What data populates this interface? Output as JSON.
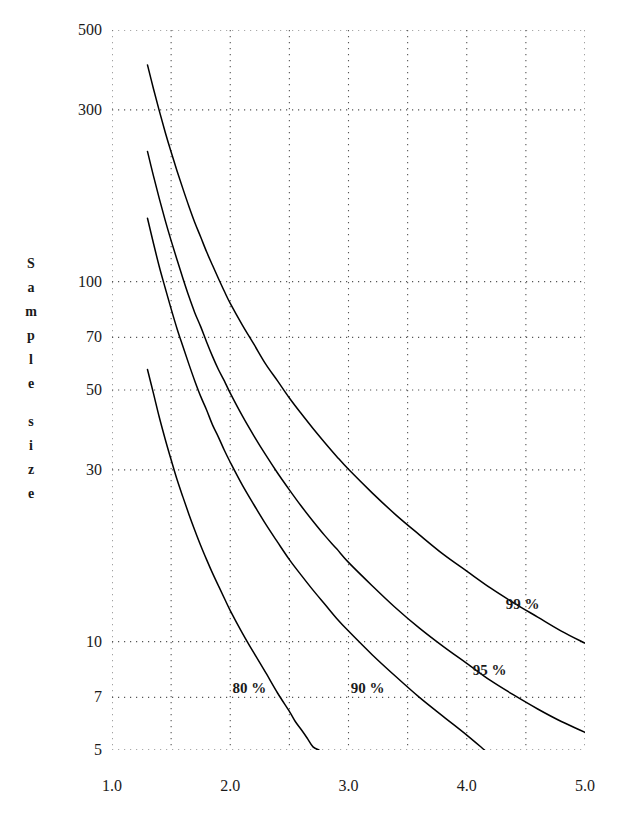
{
  "chart_data": {
    "type": "line",
    "title": "",
    "xlabel": "",
    "ylabel": "Sample size",
    "ylabel_chars": [
      "S",
      "a",
      "m",
      "p",
      "l",
      "e",
      "",
      "s",
      "i",
      "z",
      "e"
    ],
    "xlim": [
      1.0,
      5.0
    ],
    "ylim": [
      5,
      500
    ],
    "yscale": "log",
    "xscale": "linear",
    "grid": true,
    "grid_style": "dotted",
    "grid_color": "#555555",
    "line_color": "#000000",
    "background": "#ffffff",
    "legend_position": "inline-labels",
    "xticks": [
      "1.0",
      "2.0",
      "3.0",
      "4.0",
      "5.0"
    ],
    "xtick_values": [
      1.0,
      2.0,
      3.0,
      4.0,
      5.0
    ],
    "yticks": [
      "500",
      "300",
      "100",
      "70",
      "50",
      "30",
      "10",
      "7",
      "5"
    ],
    "ytick_values": [
      500,
      300,
      100,
      70,
      50,
      30,
      10,
      7,
      5
    ],
    "x_minor_gridlines": [
      1.5,
      2.5,
      3.5,
      4.5
    ],
    "series": [
      {
        "name": "80 %",
        "label": "80 %",
        "label_x": 2.02,
        "label_y": 7.4,
        "points": [
          [
            1.3,
            57
          ],
          [
            1.35,
            49
          ],
          [
            1.4,
            42
          ],
          [
            1.45,
            36.5
          ],
          [
            1.5,
            32
          ],
          [
            1.55,
            28.2
          ],
          [
            1.6,
            25.2
          ],
          [
            1.65,
            22.6
          ],
          [
            1.7,
            20.4
          ],
          [
            1.75,
            18.5
          ],
          [
            1.8,
            16.9
          ],
          [
            1.85,
            15.5
          ],
          [
            1.9,
            14.3
          ],
          [
            1.95,
            13.2
          ],
          [
            2.0,
            12.2
          ],
          [
            2.1,
            10.6
          ],
          [
            2.2,
            9.3
          ],
          [
            2.3,
            8.2
          ],
          [
            2.4,
            7.2
          ],
          [
            2.5,
            6.4
          ],
          [
            2.55,
            6.0
          ],
          [
            2.6,
            5.7
          ],
          [
            2.65,
            5.4
          ],
          [
            2.7,
            5.1
          ],
          [
            2.75,
            5.0
          ]
        ]
      },
      {
        "name": "90 %",
        "label": "90 %",
        "label_x": 3.02,
        "label_y": 7.4,
        "points": [
          [
            1.3,
            150
          ],
          [
            1.35,
            128
          ],
          [
            1.4,
            110
          ],
          [
            1.45,
            96
          ],
          [
            1.5,
            84
          ],
          [
            1.55,
            74
          ],
          [
            1.6,
            66
          ],
          [
            1.65,
            59
          ],
          [
            1.7,
            53
          ],
          [
            1.75,
            48
          ],
          [
            1.8,
            44
          ],
          [
            1.85,
            40
          ],
          [
            1.9,
            37
          ],
          [
            1.95,
            34
          ],
          [
            2.0,
            31.5
          ],
          [
            2.1,
            27.3
          ],
          [
            2.2,
            24.0
          ],
          [
            2.3,
            21.2
          ],
          [
            2.4,
            18.9
          ],
          [
            2.5,
            16.9
          ],
          [
            2.6,
            15.3
          ],
          [
            2.7,
            13.9
          ],
          [
            2.8,
            12.7
          ],
          [
            2.9,
            11.6
          ],
          [
            3.0,
            10.7
          ],
          [
            3.2,
            9.2
          ],
          [
            3.4,
            8.0
          ],
          [
            3.6,
            7.0
          ],
          [
            3.8,
            6.2
          ],
          [
            4.0,
            5.5
          ],
          [
            4.15,
            5.0
          ]
        ]
      },
      {
        "name": "95 %",
        "label": "95 %",
        "label_x": 4.05,
        "label_y": 8.3,
        "points": [
          [
            1.3,
            230
          ],
          [
            1.35,
            197
          ],
          [
            1.4,
            170
          ],
          [
            1.45,
            148
          ],
          [
            1.5,
            130
          ],
          [
            1.55,
            115
          ],
          [
            1.6,
            102
          ],
          [
            1.65,
            91
          ],
          [
            1.7,
            82
          ],
          [
            1.75,
            75
          ],
          [
            1.8,
            68
          ],
          [
            1.85,
            62
          ],
          [
            1.9,
            57
          ],
          [
            1.95,
            53
          ],
          [
            2.0,
            49
          ],
          [
            2.1,
            42.5
          ],
          [
            2.2,
            37.3
          ],
          [
            2.3,
            33.0
          ],
          [
            2.4,
            29.4
          ],
          [
            2.5,
            26.4
          ],
          [
            2.6,
            23.8
          ],
          [
            2.7,
            21.6
          ],
          [
            2.8,
            19.7
          ],
          [
            2.9,
            18.1
          ],
          [
            3.0,
            16.6
          ],
          [
            3.2,
            14.3
          ],
          [
            3.4,
            12.4
          ],
          [
            3.6,
            10.9
          ],
          [
            3.8,
            9.7
          ],
          [
            4.0,
            8.7
          ],
          [
            4.2,
            7.8
          ],
          [
            4.4,
            7.1
          ],
          [
            4.6,
            6.5
          ],
          [
            4.8,
            6.0
          ],
          [
            5.0,
            5.6
          ]
        ]
      },
      {
        "name": "99 %",
        "label": "99 %",
        "label_x": 4.33,
        "label_y": 12.6,
        "points": [
          [
            1.3,
            400
          ],
          [
            1.35,
            344
          ],
          [
            1.4,
            298
          ],
          [
            1.45,
            260
          ],
          [
            1.5,
            229
          ],
          [
            1.55,
            203
          ],
          [
            1.6,
            181
          ],
          [
            1.65,
            162
          ],
          [
            1.7,
            146
          ],
          [
            1.75,
            133
          ],
          [
            1.8,
            121
          ],
          [
            1.85,
            111
          ],
          [
            1.9,
            102
          ],
          [
            1.95,
            94
          ],
          [
            2.0,
            87
          ],
          [
            2.1,
            76
          ],
          [
            2.2,
            67
          ],
          [
            2.3,
            59
          ],
          [
            2.4,
            53
          ],
          [
            2.5,
            47.5
          ],
          [
            2.6,
            43.0
          ],
          [
            2.7,
            39.1
          ],
          [
            2.8,
            35.7
          ],
          [
            2.9,
            32.7
          ],
          [
            3.0,
            30.1
          ],
          [
            3.2,
            25.9
          ],
          [
            3.4,
            22.5
          ],
          [
            3.6,
            19.8
          ],
          [
            3.8,
            17.5
          ],
          [
            4.0,
            15.7
          ],
          [
            4.2,
            14.1
          ],
          [
            4.4,
            12.8
          ],
          [
            4.6,
            11.7
          ],
          [
            4.8,
            10.7
          ],
          [
            5.0,
            9.9
          ]
        ]
      }
    ]
  }
}
